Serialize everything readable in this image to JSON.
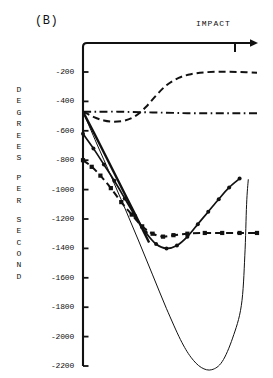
{
  "panel": {
    "label": "(B)"
  },
  "annotations": {
    "impact": "IMPACT"
  },
  "axis": {
    "y_title_chars": [
      "D",
      "E",
      "G",
      "R",
      "E",
      "E",
      "S",
      "",
      "P",
      "E",
      "R",
      "",
      "S",
      "E",
      "C",
      "O",
      "N",
      "D"
    ],
    "y_title_text": "DEGREES PER SECOND"
  },
  "chart_data": {
    "type": "line",
    "title": "(B)",
    "xlabel": "",
    "ylabel": "DEGREES PER SECOND",
    "grid": false,
    "legend": "none",
    "xlim": [
      0,
      100
    ],
    "ylim": [
      -2300,
      -60
    ],
    "yticks": [
      -200,
      -400,
      -600,
      -800,
      -1000,
      -1200,
      -1400,
      -1600,
      -1800,
      -2000,
      -2200
    ],
    "ytick_labels": [
      "-200",
      "-400",
      "-600",
      "-800",
      "-1000",
      "-1200",
      "-1400",
      "-1600",
      "-1800",
      "-2000",
      "-2200"
    ],
    "annotations": [
      {
        "text": "IMPACT",
        "x": 88,
        "y": -80,
        "marker": "tick-on-top-axis"
      }
    ],
    "series": [
      {
        "name": "dash-dot-flat",
        "style": "dashdot",
        "marker": "none",
        "x": [
          0,
          6,
          12,
          20,
          28,
          36,
          44,
          52,
          60,
          70,
          80,
          90,
          100
        ],
        "values": [
          -470,
          -470,
          -470,
          -470,
          -472,
          -474,
          -476,
          -478,
          -480,
          -480,
          -480,
          -480,
          -480
        ]
      },
      {
        "name": "dashed-rise",
        "style": "dashed",
        "marker": "none",
        "x": [
          0,
          6,
          12,
          18,
          24,
          30,
          36,
          42,
          48,
          55,
          62,
          70,
          80,
          90,
          100
        ],
        "values": [
          -470,
          -505,
          -530,
          -538,
          -530,
          -500,
          -440,
          -360,
          -290,
          -240,
          -215,
          -202,
          -198,
          -200,
          -205
        ]
      },
      {
        "name": "thick-solid-descent",
        "style": "solid-thick",
        "marker": "none",
        "x": [
          0,
          10,
          20,
          30,
          38
        ],
        "values": [
          -470,
          -700,
          -935,
          -1170,
          -1360
        ]
      },
      {
        "name": "square-markers",
        "style": "dashed",
        "marker": "square",
        "x": [
          0,
          5,
          10,
          16,
          22,
          28,
          34,
          40,
          46,
          52,
          60,
          70,
          80,
          90,
          100
        ],
        "values": [
          -800,
          -845,
          -905,
          -990,
          -1085,
          -1170,
          -1250,
          -1300,
          -1320,
          -1310,
          -1300,
          -1295,
          -1295,
          -1295,
          -1295
        ]
      },
      {
        "name": "dot-markers",
        "style": "solid",
        "marker": "dot",
        "x": [
          0,
          6,
          12,
          18,
          24,
          30,
          36,
          42,
          48,
          54,
          60,
          66,
          72,
          78,
          84,
          90
        ],
        "values": [
          -620,
          -720,
          -830,
          -940,
          -1060,
          -1180,
          -1290,
          -1370,
          -1400,
          -1380,
          -1320,
          -1235,
          -1150,
          -1065,
          -985,
          -925
        ]
      },
      {
        "name": "thin-solid-v",
        "style": "solid-thin",
        "marker": "none",
        "x": [
          0,
          8,
          16,
          24,
          32,
          40,
          48,
          56,
          62,
          68,
          74,
          80,
          86,
          91,
          93,
          94,
          95
        ],
        "values": [
          -470,
          -690,
          -905,
          -1125,
          -1350,
          -1580,
          -1810,
          -2020,
          -2140,
          -2210,
          -2225,
          -2170,
          -2010,
          -1790,
          -1450,
          -1100,
          -930
        ]
      }
    ]
  }
}
